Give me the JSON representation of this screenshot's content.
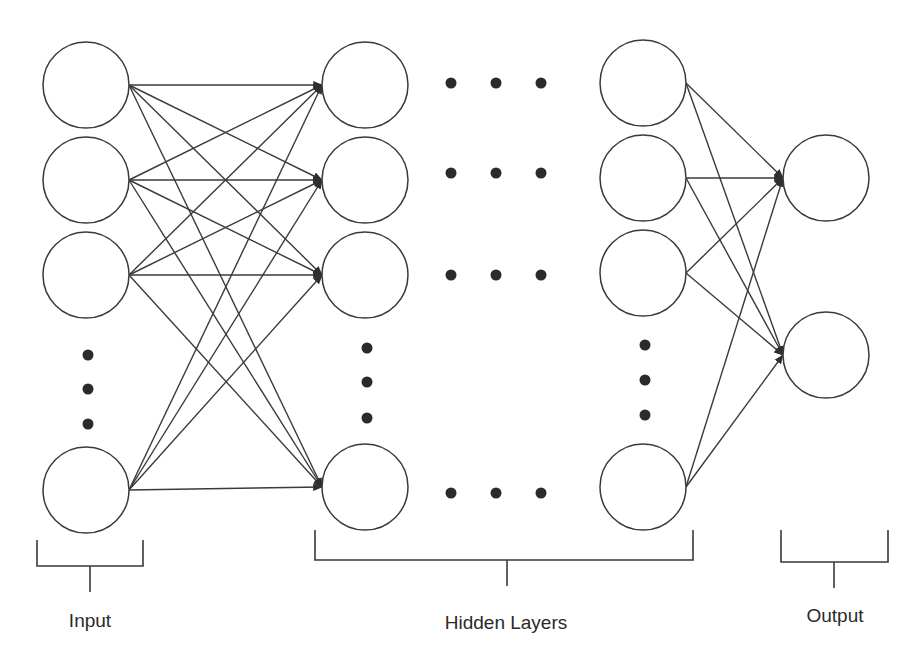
{
  "diagram": {
    "labels": {
      "input": "Input",
      "hidden": "Hidden Layers",
      "output": "Output"
    },
    "colors": {
      "stroke": "#3a3a3a",
      "dot": "#2b2b2b",
      "text": "#2a2a2a",
      "background": "#ffffff"
    },
    "node_radius": 43,
    "layers": [
      {
        "name": "input",
        "x": 86,
        "nodes_y": [
          85,
          180,
          275,
          490
        ],
        "ellipsis_dots_y": [
          355,
          389,
          424
        ]
      },
      {
        "name": "hidden-1",
        "x": 365,
        "nodes_y": [
          85,
          180,
          275,
          487
        ],
        "ellipsis_dots_y": [
          348,
          382,
          418
        ]
      },
      {
        "name": "hidden-last",
        "x": 643,
        "nodes_y": [
          83,
          178,
          273,
          487
        ],
        "ellipsis_dots_y": [
          345,
          380,
          415
        ]
      },
      {
        "name": "output",
        "x": 826,
        "nodes_y": [
          178,
          355
        ],
        "ellipsis_dots_y": []
      }
    ],
    "horizontal_ellipsis": {
      "x": [
        451,
        496,
        541
      ],
      "rows_y": [
        83,
        173,
        275,
        493
      ]
    },
    "brackets": [
      {
        "name": "input",
        "x1": 37,
        "x2": 143,
        "top": 540,
        "base": 566,
        "stem_x": 90,
        "stem_bottom": 592,
        "label_y": 610
      },
      {
        "name": "hidden",
        "x1": 315,
        "x2": 693,
        "top": 530,
        "base": 560,
        "stem_x": 507,
        "stem_bottom": 586,
        "label_y": 612
      },
      {
        "name": "output",
        "x1": 781,
        "x2": 888,
        "top": 530,
        "base": 562,
        "stem_x": 834,
        "stem_bottom": 588,
        "label_y": 605
      }
    ]
  }
}
